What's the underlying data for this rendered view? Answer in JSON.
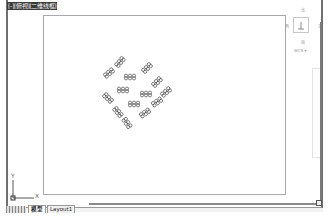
{
  "viewport": {
    "label": "[-][俯视][二维线框]"
  },
  "viewcube": {
    "north": "北",
    "south": "南",
    "west": "西",
    "east": "东",
    "top_face": "上",
    "coordinate_system": "WCS ▾"
  },
  "ucs_icon": {
    "x_label": "X",
    "y_label": "Y"
  },
  "layout_tabs": {
    "items": [
      {
        "label": "模型",
        "active": true
      },
      {
        "label": "Layout1",
        "active": false
      }
    ]
  },
  "drawing": {
    "paper_bounds": {
      "x": 43,
      "y": 15,
      "width": 243,
      "height": 180
    },
    "objects": [
      {
        "type": "chain-link-cluster",
        "x": 120,
        "y": 62,
        "angle": -50
      },
      {
        "type": "chain-link-cluster",
        "x": 109,
        "y": 73,
        "angle": -40
      },
      {
        "type": "chain-link-cluster",
        "x": 147,
        "y": 68,
        "angle": -45
      },
      {
        "type": "chain-link-cluster",
        "x": 130,
        "y": 77,
        "angle": 0
      },
      {
        "type": "chain-link-cluster",
        "x": 157,
        "y": 82,
        "angle": -45
      },
      {
        "type": "chain-link-cluster",
        "x": 123,
        "y": 90,
        "angle": 0
      },
      {
        "type": "chain-link-cluster",
        "x": 146,
        "y": 94,
        "angle": 0
      },
      {
        "type": "chain-link-cluster",
        "x": 108,
        "y": 98,
        "angle": 45
      },
      {
        "type": "chain-link-cluster",
        "x": 166,
        "y": 92,
        "angle": -40
      },
      {
        "type": "chain-link-cluster",
        "x": 134,
        "y": 104,
        "angle": 0
      },
      {
        "type": "chain-link-cluster",
        "x": 157,
        "y": 102,
        "angle": -35
      },
      {
        "type": "chain-link-cluster",
        "x": 118,
        "y": 112,
        "angle": 50
      },
      {
        "type": "chain-link-cluster",
        "x": 145,
        "y": 113,
        "angle": -35
      },
      {
        "type": "chain-link-cluster",
        "x": 127,
        "y": 123,
        "angle": 55
      }
    ]
  },
  "colors": {
    "frame_border": "#6f6f6f",
    "paper_border": "#a9a9a9",
    "stroke": "#4a4a4a",
    "background": "#ffffff"
  }
}
